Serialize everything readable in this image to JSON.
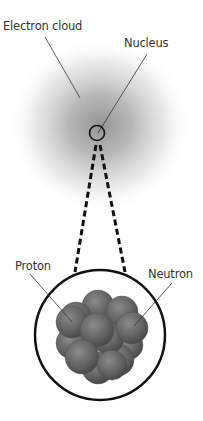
{
  "diagram": {
    "labels": {
      "electron_cloud": "Electron cloud",
      "nucleus": "Nucleus",
      "proton": "Proton",
      "neutron": "Neutron"
    },
    "colors": {
      "cloud": "#9a9a9a",
      "particle": "#6b6b6b",
      "outline": "#111111",
      "text": "#333333"
    }
  }
}
